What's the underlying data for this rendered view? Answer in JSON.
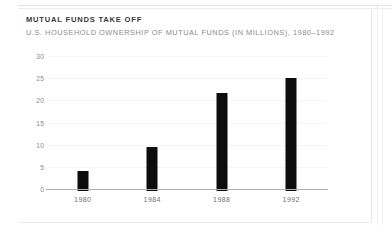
{
  "chart_data": {
    "type": "bar",
    "title": "MUTUAL FUNDS TAKE OFF",
    "subtitle": "U.S. HOUSEHOLD OWNERSHIP OF MUTUAL FUNDS (IN MILLIONS), 1980–1992",
    "xlabel": "",
    "ylabel": "",
    "unit": "millions of households",
    "categories": [
      "1980",
      "1984",
      "1988",
      "1992"
    ],
    "values": [
      4.6,
      10.0,
      22.0,
      25.5
    ],
    "ylim": [
      0,
      30
    ],
    "ytick_step": 5,
    "yticks": [
      "30",
      "25",
      "20",
      "15",
      "10",
      "5",
      "0"
    ],
    "grid": true,
    "grid_axis": "y",
    "legend": "none",
    "bar_color": "#0d0d0d",
    "axis_color": "#b0b0b0",
    "grid_color": "#f4f4f4",
    "title_color": "#3b3b3b",
    "subtitle_color": "#8c8c8c",
    "tick_label_color": "#8a8a8a",
    "category_label_color": "#6f6f6f",
    "background_color": "#ffffff"
  }
}
